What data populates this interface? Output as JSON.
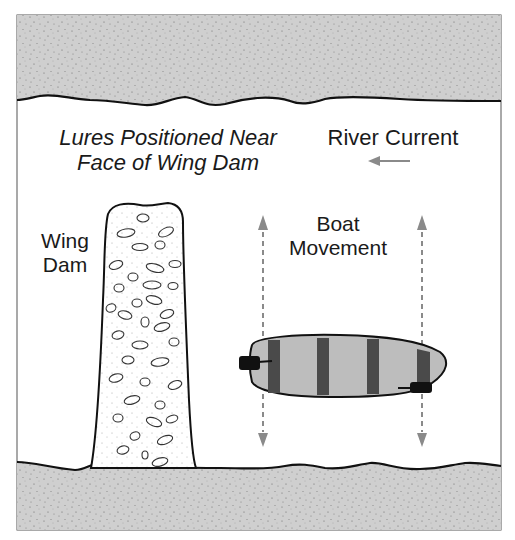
{
  "diagram": {
    "labels": {
      "lures_line1": "Lures Positioned Near",
      "lures_line2": "Face of Wing Dam",
      "river_current": "River Current",
      "wing_dam_line1": "Wing",
      "wing_dam_line2": "Dam",
      "boat_movement_line1": "Boat",
      "boat_movement_line2": "Movement"
    },
    "icons": {
      "current_arrow": "arrow-left",
      "boat_path": "dashed-vertical-arrows-up-down"
    },
    "colors": {
      "bank_fill": "#cfcfcf",
      "water": "#ffffff",
      "boat_fill": "#bdbdbd",
      "boat_stripes": "#4a4a4a",
      "arrows": "#8a8a8a",
      "outline": "#1a1a1a"
    }
  }
}
